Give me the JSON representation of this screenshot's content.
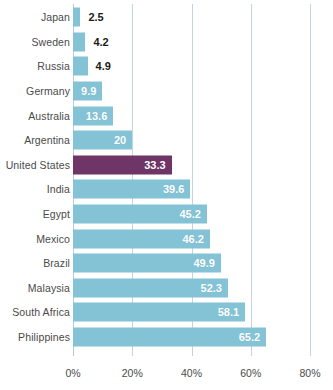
{
  "chart_data": {
    "type": "bar",
    "orientation": "horizontal",
    "title": "",
    "subtitle": "",
    "xlabel": "",
    "ylabel": "",
    "xlim": [
      0,
      80
    ],
    "grid": true,
    "legend": false,
    "x_tick_labels": [
      "0%",
      "20%",
      "40%",
      "60%",
      "80%"
    ],
    "x_tick_values": [
      0,
      20,
      40,
      60,
      80
    ],
    "categories": [
      "Japan",
      "Sweden",
      "Russia",
      "Germany",
      "Australia",
      "Argentina",
      "United States",
      "India",
      "Egypt",
      "Mexico",
      "Brazil",
      "Malaysia",
      "South Africa",
      "Philippines"
    ],
    "values": [
      2.5,
      4.2,
      4.9,
      9.9,
      13.6,
      20,
      33.3,
      39.6,
      45.2,
      46.2,
      49.9,
      52.3,
      58.1,
      65.2
    ],
    "value_labels": [
      "2.5",
      "4.2",
      "4.9",
      "9.9",
      "13.6",
      "20",
      "33.3",
      "39.6",
      "45.2",
      "46.2",
      "49.9",
      "52.3",
      "58.1",
      "65.2"
    ],
    "label_placement": [
      "outside",
      "outside",
      "outside",
      "inside",
      "inside",
      "inside",
      "inside",
      "inside",
      "inside",
      "inside",
      "inside",
      "inside",
      "inside",
      "inside"
    ],
    "highlighted_category": "United States",
    "colors": {
      "bar": "#83c3d5",
      "highlight_bar": "#6e3566",
      "gridline": "#c3d3e2",
      "background": "#ffffff",
      "category_label": "#4a4a4a",
      "value_label_inside": "#ffffff",
      "value_label_outside": "#1a1a1a"
    }
  }
}
